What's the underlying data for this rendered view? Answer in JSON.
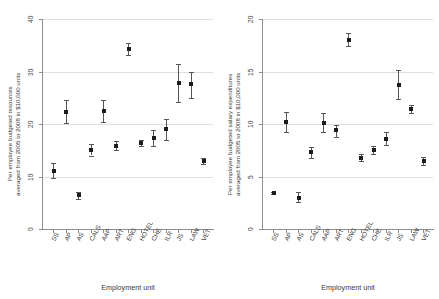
{
  "figure": {
    "panels": [
      {
        "id": "left",
        "ytitle_line1": "Per employee budgeted resources",
        "ytitle_line2": "averaged from 2005 to 2008 in $10,000 units",
        "xtitle": "Employment unit"
      },
      {
        "id": "right",
        "ytitle_line1": "Per employee budgeted salary expenditures",
        "ytitle_line2": "averaged from 2005 to 2008 in $10,000 units",
        "xtitle": "Employment unit"
      }
    ]
  },
  "chart_data": [
    {
      "type": "scatter",
      "panel": "left",
      "title": "",
      "xlabel": "Employment unit",
      "ylabel": "Per employee budgeted resources averaged from 2005 to 2008 in $10,000 units",
      "categories": [
        "SS",
        "AP",
        "AS",
        "CALS",
        "AAP",
        "ART",
        "ENG",
        "HOTEL",
        "CHE",
        "ILR",
        "JS",
        "LAW",
        "VET"
      ],
      "values": [
        11.1,
        22.3,
        6.4,
        15.1,
        22.5,
        15.9,
        34.2,
        16.3,
        17.4,
        19.0,
        27.9,
        27.6,
        12.9
      ],
      "ci_low": [
        9.8,
        20.1,
        5.7,
        14.0,
        20.4,
        15.1,
        33.1,
        15.8,
        15.9,
        16.9,
        24.1,
        25.0,
        12.3
      ],
      "ci_high": [
        12.6,
        24.6,
        7.1,
        16.2,
        24.6,
        16.7,
        35.4,
        16.9,
        18.9,
        21.0,
        31.4,
        30.0,
        13.5
      ],
      "ylim": [
        0,
        40
      ],
      "yticks": [
        "0",
        "10",
        "20",
        "30",
        "40"
      ],
      "grid": true,
      "legend": "none",
      "marker": "square",
      "error_bars": "95% CI"
    },
    {
      "type": "scatter",
      "panel": "right",
      "title": "",
      "xlabel": "Employment unit",
      "ylabel": "Per employee budgeted salary expenditures averaged from 2005 to 2008 in $10,000 units",
      "categories": [
        "SS",
        "AP",
        "AS",
        "CALS",
        "AAP",
        "ART",
        "ENG",
        "HOTEL",
        "CHE",
        "ILR",
        "JS",
        "LAW",
        "VET"
      ],
      "values": [
        3.4,
        10.2,
        3.0,
        7.3,
        10.1,
        9.4,
        18.0,
        6.8,
        7.5,
        8.6,
        13.7,
        11.4,
        6.5
      ],
      "ci_low": [
        3.3,
        9.2,
        2.6,
        6.8,
        9.2,
        8.8,
        17.4,
        6.5,
        7.1,
        8.0,
        12.4,
        11.0,
        6.1
      ],
      "ci_high": [
        3.5,
        11.1,
        3.5,
        7.8,
        11.0,
        9.9,
        18.7,
        7.1,
        7.9,
        9.2,
        15.1,
        11.8,
        6.9
      ],
      "ylim": [
        0,
        20
      ],
      "yticks": [
        "0",
        "5",
        "10",
        "15",
        "20"
      ],
      "grid": true,
      "legend": "none",
      "marker": "square",
      "error_bars": "95% CI"
    }
  ]
}
